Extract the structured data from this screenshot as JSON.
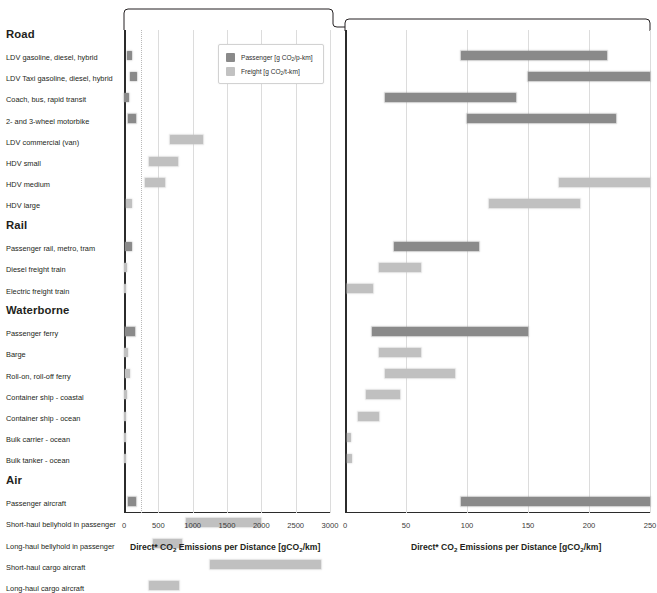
{
  "legend": {
    "passenger_label": "Passenger [g CO",
    "passenger_sub": "2",
    "passenger_tail": "/p-km]",
    "freight_label": "Freight [g CO",
    "freight_sub": "2",
    "freight_tail": "/t-km]",
    "passenger_color": "#8a8a8a",
    "freight_color": "#c2c2c2"
  },
  "axis": {
    "title_a": "Direct* CO",
    "title_sub": "2",
    "title_b": " Emissions per Distance [gCO",
    "title_sub2": "2",
    "title_c": "/km]"
  },
  "chart_data": {
    "type": "bar",
    "title": "Direct* CO2 Emissions per Distance [gCO2/km]",
    "xlabel": "Direct* CO2 Emissions per Distance [gCO2/km]",
    "ylabel": "",
    "grid": true,
    "legend": [
      "Passenger [g CO2/p-km]",
      "Freight [g CO2/t-km]"
    ],
    "panels": [
      {
        "name": "left",
        "xlim": [
          0,
          3000
        ],
        "ticks": [
          0,
          500,
          1000,
          1500,
          2000,
          2500,
          3000
        ],
        "tick_labels": [
          "0",
          "500",
          "1000",
          "1500",
          "2000",
          "2500",
          "3000"
        ],
        "dotted_gridline": 250
      },
      {
        "name": "right",
        "xlim": [
          0,
          250
        ],
        "ticks": [
          0,
          50,
          100,
          150,
          200,
          250
        ],
        "tick_labels": [
          "0",
          "50",
          "100",
          "150",
          "200",
          "250"
        ]
      }
    ],
    "groups": [
      {
        "group": "Road",
        "rows": [
          {
            "label": "LDV gasoline, diesel, hybrid",
            "series": "passenger",
            "left": [
              40,
              115
            ],
            "right": [
              95,
              215
            ]
          },
          {
            "label": "LDV Taxi gasoline, diesel, hybrid",
            "series": "passenger",
            "left": [
              85,
              190
            ],
            "right": [
              150,
              250
            ]
          },
          {
            "label": "Coach, bus, rapid transit",
            "series": "passenger",
            "left": [
              0,
              70
            ],
            "right": [
              33,
              140
            ]
          },
          {
            "label": "2- and 3-wheel motorbike",
            "series": "passenger",
            "left": [
              65,
              175
            ],
            "right": [
              100,
              222
            ]
          },
          {
            "label": "LDV commercial (van)",
            "series": "freight",
            "left": [
              670,
              1150
            ],
            "right": null
          },
          {
            "label": "HDV small",
            "series": "freight",
            "left": [
              370,
              790
            ],
            "right": null
          },
          {
            "label": "HDV medium",
            "series": "freight",
            "left": [
              300,
              600
            ],
            "right": [
              175,
              250
            ]
          },
          {
            "label": "HDV large",
            "series": "freight",
            "left": [
              35,
              120
            ],
            "right": [
              118,
              193
            ]
          }
        ]
      },
      {
        "group": "Rail",
        "rows": [
          {
            "label": "Passenger rail, metro, tram",
            "series": "passenger",
            "left": [
              20,
              110
            ],
            "right": [
              40,
              110
            ]
          },
          {
            "label": "Diesel freight train",
            "series": "freight",
            "left": [
              0,
              45
            ],
            "right": [
              28,
              62
            ]
          },
          {
            "label": "Electric freight train",
            "series": "freight",
            "left": [
              0,
              30
            ],
            "right": [
              2,
              23
            ]
          }
        ]
      },
      {
        "group": "Waterborne",
        "rows": [
          {
            "label": "Passenger ferry",
            "series": "passenger",
            "left": [
              20,
              160
            ],
            "right": [
              22,
              150
            ]
          },
          {
            "label": "Barge",
            "series": "freight",
            "left": [
              0,
              55
            ],
            "right": [
              28,
              62
            ]
          },
          {
            "label": "Roll-on, roll-off ferry",
            "series": "freight",
            "left": [
              10,
              90
            ],
            "right": [
              33,
              90
            ]
          },
          {
            "label": "Container ship  - coastal",
            "series": "freight",
            "left": [
              0,
              45
            ],
            "right": [
              17,
              45
            ]
          },
          {
            "label": "Container ship - ocean",
            "series": "freight",
            "left": [
              0,
              35
            ],
            "right": [
              11,
              28
            ]
          },
          {
            "label": "Bulk carrier - ocean",
            "series": "freight",
            "left": [
              0,
              20
            ],
            "right": [
              2,
              5
            ]
          },
          {
            "label": "Bulk tanker - ocean",
            "series": "freight",
            "left": [
              0,
              22
            ],
            "right": [
              2,
              6
            ]
          }
        ]
      },
      {
        "group": "Air",
        "rows": [
          {
            "label": "Passenger aircraft",
            "series": "passenger",
            "left": [
              60,
              170
            ],
            "right": [
              95,
              250
            ]
          },
          {
            "label": "Short-haul bellyhold in passenger",
            "series": "freight",
            "left": [
              900,
              2000
            ],
            "right": null
          },
          {
            "label": "Long-haul bellyhold in passenger",
            "series": "freight",
            "left": [
              420,
              840
            ],
            "right": null
          },
          {
            "label": "Short-haul cargo aircraft",
            "series": "freight",
            "left": [
              1250,
              2870
            ],
            "right": null
          },
          {
            "label": "Long-haul cargo aircraft",
            "series": "freight",
            "left": [
              370,
              800
            ],
            "right": null
          }
        ]
      }
    ]
  }
}
